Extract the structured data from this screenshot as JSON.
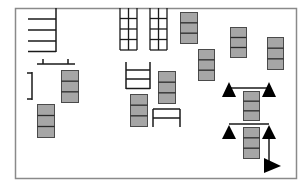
{
  "diagram": {
    "title": "",
    "colors": {
      "background": "#ffffff",
      "border": "#8a8a8a",
      "line": "#1a1a1a",
      "block_fill": "#a6a6a6",
      "block_stroke": "#4a4a4a"
    },
    "elements": [
      {
        "type": "comb",
        "name": "shelf-comb"
      },
      {
        "type": "bracket",
        "name": "bench-bracket-top"
      },
      {
        "type": "bracket",
        "name": "bench-bracket-left"
      },
      {
        "type": "stacked-block",
        "name": "storage-block-1",
        "cells": 3
      },
      {
        "type": "stacked-block",
        "name": "storage-block-2",
        "cells": 3
      },
      {
        "type": "grid-shelf",
        "name": "grid-shelf-1",
        "cols": 2,
        "rows": 4
      },
      {
        "type": "grid-shelf",
        "name": "grid-shelf-2",
        "cols": 2,
        "rows": 4
      },
      {
        "type": "stacked-block",
        "name": "storage-block-3",
        "cells": 3
      },
      {
        "type": "ladder",
        "name": "ladder-rack"
      },
      {
        "type": "stacked-block",
        "name": "storage-block-4",
        "cells": 3
      },
      {
        "type": "stacked-block",
        "name": "storage-block-5",
        "cells": 3
      },
      {
        "type": "table",
        "name": "work-table"
      },
      {
        "type": "stacked-block",
        "name": "storage-block-6",
        "cells": 3
      },
      {
        "type": "stacked-block",
        "name": "storage-block-7",
        "cells": 3
      },
      {
        "type": "stacked-block",
        "name": "storage-block-8",
        "cells": 3
      },
      {
        "type": "station",
        "name": "triangle-station-1",
        "cells": 3
      },
      {
        "type": "station",
        "name": "triangle-station-2",
        "cells": 3
      },
      {
        "type": "arrow",
        "name": "exit-arrow",
        "direction": "right"
      }
    ]
  }
}
